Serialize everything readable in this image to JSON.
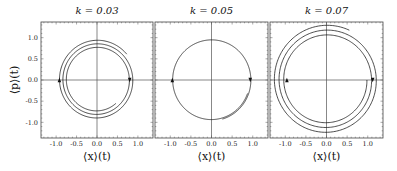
{
  "chart_data": [
    {
      "type": "line",
      "title": "k = 0.03",
      "xlabel": "⟨x⟩(t)",
      "ylabel": "⟨p⟩(t)",
      "xlim": [
        -1.37,
        1.37
      ],
      "ylim": [
        -1.37,
        1.37
      ],
      "xticks": [
        "-1.0",
        "-0.5",
        "0.0",
        "0.5",
        "1.0"
      ],
      "yticks": [
        "1.0",
        "0.5",
        "0.0",
        "-0.5",
        "-1.0"
      ],
      "description": "outward clockwise spiral, ~3 turns, radius 0.70 → 0.92",
      "spiral": {
        "r_start": 0.72,
        "r_end": 0.95,
        "theta_start_deg": -50,
        "turns": 2.75
      },
      "arrows": [
        {
          "x": 0.8,
          "y": 0.0,
          "dir": "down"
        },
        {
          "x": -0.92,
          "y": 0.0,
          "dir": "up"
        }
      ]
    },
    {
      "type": "line",
      "title": "k = 0.05",
      "xlabel": "⟨x⟩(t)",
      "ylabel": "",
      "xlim": [
        -1.37,
        1.37
      ],
      "ylim": [
        -1.37,
        1.37
      ],
      "xticks": [
        "-1.0",
        "-0.5",
        "0.0",
        "0.5",
        "1.0"
      ],
      "yticks": [],
      "description": "near-closed limit cycle, radius ≈ 0.95",
      "spiral": {
        "r_start": 0.93,
        "r_end": 0.96,
        "theta_start_deg": -20,
        "turns": 1.15
      },
      "arrows": [
        {
          "x": 0.94,
          "y": 0.0,
          "dir": "down"
        },
        {
          "x": -0.95,
          "y": 0.0,
          "dir": "up"
        }
      ]
    },
    {
      "type": "line",
      "title": "k = 0.07",
      "xlabel": "⟨x⟩(t)",
      "ylabel": "",
      "xlim": [
        -1.37,
        1.37
      ],
      "ylim": [
        -1.37,
        1.37
      ],
      "xticks": [
        "-1.0",
        "-0.5",
        "0.0",
        "0.5",
        "1.0"
      ],
      "yticks": [],
      "description": "outward clockwise spiral, ~3 turns, radius 1.0 → 1.27",
      "spiral": {
        "r_start": 0.98,
        "r_end": 1.3,
        "theta_start_deg": 0,
        "turns": 2.82
      },
      "arrows": [
        {
          "x": 1.12,
          "y": 0.0,
          "dir": "down"
        },
        {
          "x": -0.96,
          "y": 0.0,
          "dir": "up"
        }
      ]
    }
  ],
  "layout": {
    "panels": [
      {
        "left": 41,
        "right": 153,
        "top": 22,
        "bottom": 138
      },
      {
        "left": 155,
        "right": 268,
        "top": 22,
        "bottom": 138
      },
      {
        "left": 270,
        "right": 383,
        "top": 22,
        "bottom": 138
      }
    ]
  }
}
